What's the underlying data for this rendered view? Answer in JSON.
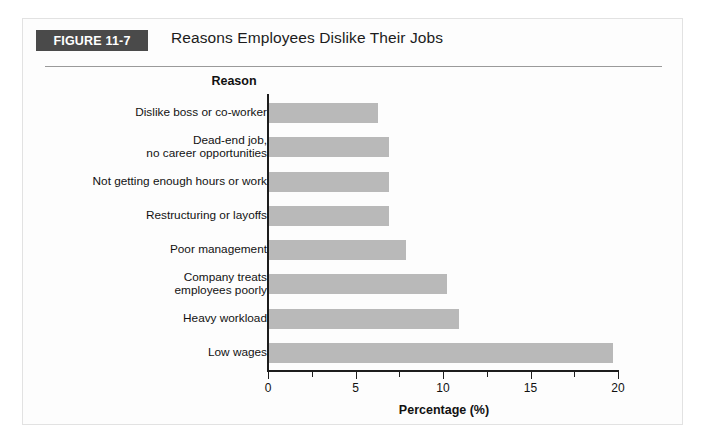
{
  "figure": {
    "badge_label": "FIGURE 11-7",
    "title": "Reasons Employees Dislike Their Jobs"
  },
  "colors": {
    "badge_background": "#4a4a4a",
    "badge_text": "#ffffff",
    "bar_fill": "#b9b9b9",
    "axis": "#1d1d1d",
    "card_background": "#fdfdfd",
    "card_border": "#e2e2e2",
    "rule": "#9a9a9a"
  },
  "chart_data": {
    "type": "bar",
    "orientation": "horizontal",
    "title": "Reasons Employees Dislike Their Jobs",
    "xlabel": "Percentage (%)",
    "ylabel": "Reason",
    "categories": [
      "Dislike boss or co-worker",
      "Dead-end job,\nno career opportunities",
      "Not getting enough hours or work",
      "Restructuring or layoffs",
      "Poor management",
      "Company treats\nemployees poorly",
      "Heavy workload",
      "Low wages"
    ],
    "values": [
      6.3,
      6.9,
      6.9,
      6.9,
      7.9,
      10.2,
      10.9,
      19.7
    ],
    "xlim": [
      0,
      20
    ],
    "xticks": [
      0,
      5,
      10,
      15,
      20
    ],
    "xtick_labels": [
      "0",
      "5",
      "10",
      "15",
      "20"
    ],
    "minor_xticks": [
      2.5,
      7.5,
      12.5,
      17.5
    ],
    "grid": false,
    "legend": false
  }
}
